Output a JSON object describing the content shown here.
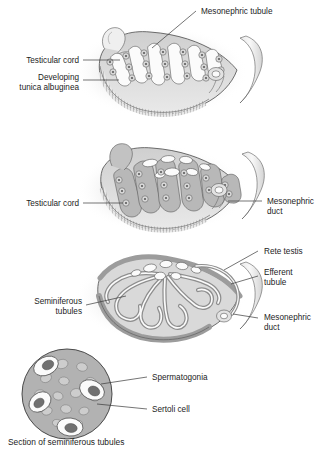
{
  "figure": {
    "title_caption": "Section of seminiferous tubules",
    "panels": [
      {
        "id": "panel-1",
        "name": "indifferent-gonad-testicular-cords",
        "labels": [
          {
            "key": "mesonephric_tubule",
            "text": "Mesonephric tubule",
            "align": "left"
          },
          {
            "key": "testicular_cord",
            "text": "Testicular cord",
            "align": "right"
          },
          {
            "key": "developing_tunica_albuginea_line1",
            "text": "Developing",
            "align": "right"
          },
          {
            "key": "developing_tunica_albuginea_line2",
            "text": "tunica albuginea",
            "align": "right"
          }
        ]
      },
      {
        "id": "panel-2",
        "name": "testis-with-cords-and-duct",
        "labels": [
          {
            "key": "testicular_cord",
            "text": "Testicular cord",
            "align": "right"
          },
          {
            "key": "mesonephric_duct_line1",
            "text": "Mesonephric",
            "align": "left"
          },
          {
            "key": "mesonephric_duct_line2",
            "text": "duct",
            "align": "left"
          }
        ]
      },
      {
        "id": "panel-3",
        "name": "mature-testis-seminiferous-tubules",
        "labels": [
          {
            "key": "rete_testis",
            "text": "Rete testis",
            "align": "left"
          },
          {
            "key": "efferent_tubule_line1",
            "text": "Efferent",
            "align": "left"
          },
          {
            "key": "efferent_tubule_line2",
            "text": "tubule",
            "align": "left"
          },
          {
            "key": "seminiferous_tubules_line1",
            "text": "Seminiferous",
            "align": "right"
          },
          {
            "key": "seminiferous_tubules_line2",
            "text": "tubules",
            "align": "right"
          },
          {
            "key": "mesonephric_duct_line1",
            "text": "Mesonephric",
            "align": "left"
          },
          {
            "key": "mesonephric_duct_line2",
            "text": "duct",
            "align": "left"
          }
        ]
      },
      {
        "id": "panel-4",
        "name": "seminiferous-tubule-cross-section",
        "labels": [
          {
            "key": "spermatogonia",
            "text": "Spermatogonia",
            "align": "left"
          },
          {
            "key": "sertoli_cell",
            "text": "Sertoli cell",
            "align": "left"
          }
        ]
      }
    ]
  },
  "colors": {
    "background": "#ffffff",
    "tissue_mid_gray": "#b4b4b4",
    "tissue_light_gray": "#d2d2d2",
    "tissue_pale": "#e4e4e4",
    "lumen_white": "#fafafa",
    "nucleus_dark": "#6a6a6a",
    "outline": "#4a4a4a",
    "text": "#1c1c1c",
    "leader_line": "#3a3a3a"
  }
}
